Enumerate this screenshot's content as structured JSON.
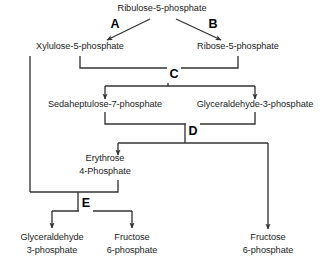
{
  "diagram": {
    "type": "flow-diagram",
    "line_color": "#333333",
    "text_color": "#1c1c1c",
    "background": "#ffffff"
  },
  "metabolites": {
    "ribulose5p": {
      "label": "Ribulose-5-phosphate",
      "x": 162,
      "y": 11
    },
    "xylulose5p": {
      "label": "Xylulose-5-phosphate",
      "x": 80,
      "y": 49
    },
    "ribose5p": {
      "label": "Ribose-5-phosphate",
      "x": 238,
      "y": 49
    },
    "sedaheptulose7p": {
      "label": "Sedaheptulose-7-phosphate",
      "x": 105,
      "y": 107
    },
    "glyceraldehyde3p_mid": {
      "label": "Glyceraldehyde-3-phosphate",
      "x": 255,
      "y": 107
    },
    "erythrose4p_line1": {
      "label": "Erythrose",
      "x": 105,
      "y": 161
    },
    "erythrose4p_line2": {
      "label": "4-Phosphate",
      "x": 105,
      "y": 174
    },
    "glyceraldehyde3p_out_line1": {
      "label": "Glyceraldehyde",
      "x": 52,
      "y": 240
    },
    "glyceraldehyde3p_out_line2": {
      "label": "3-phosphate",
      "x": 52,
      "y": 253
    },
    "fructose6p_left_line1": {
      "label": "Fructose",
      "x": 132,
      "y": 240
    },
    "fructose6p_left_line2": {
      "label": "6-phosphate",
      "x": 132,
      "y": 253
    },
    "fructose6p_right_line1": {
      "label": "Fructose",
      "x": 268,
      "y": 240
    },
    "fructose6p_right_line2": {
      "label": "6-phosphate",
      "x": 268,
      "y": 253
    }
  },
  "steps": {
    "a": {
      "label": "A",
      "x": 115,
      "y": 28
    },
    "b": {
      "label": "B",
      "x": 213,
      "y": 28
    },
    "c": {
      "label": "C",
      "x": 174,
      "y": 74
    },
    "d": {
      "label": "D",
      "x": 193,
      "y": 131
    },
    "e": {
      "label": "E",
      "x": 86,
      "y": 203
    }
  },
  "reactions": [
    {
      "id": "reaction-a",
      "from": "Ribulose-5-phosphate",
      "to": "Xylulose-5-phosphate",
      "enzyme_label": "A"
    },
    {
      "id": "reaction-b",
      "from": "Ribulose-5-phosphate",
      "to": "Ribose-5-phosphate",
      "enzyme_label": "B"
    },
    {
      "id": "reaction-c",
      "from": "Xylulose-5-phosphate + Ribose-5-phosphate",
      "to": "Sedaheptulose-7-phosphate + Glyceraldehyde-3-phosphate",
      "enzyme_label": "C"
    },
    {
      "id": "reaction-d",
      "from": "Sedaheptulose-7-phosphate + Glyceraldehyde-3-phosphate",
      "to": "Erythrose 4-Phosphate + Fructose 6-phosphate",
      "enzyme_label": "D"
    },
    {
      "id": "reaction-e",
      "from": "Xylulose-5-phosphate + Erythrose 4-Phosphate",
      "to": "Glyceraldehyde 3-phosphate + Fructose 6-phosphate",
      "enzyme_label": "E"
    }
  ]
}
